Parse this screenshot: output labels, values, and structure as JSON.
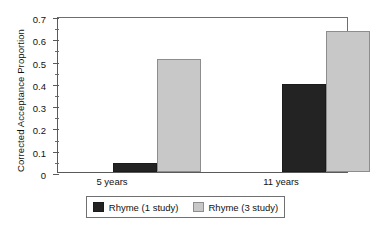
{
  "chart_data": {
    "type": "bar",
    "title": "",
    "xlabel": "",
    "ylabel": "Corrected Acceptance Proportion",
    "categories": [
      "5 years",
      "11 years"
    ],
    "series": [
      {
        "name": "Rhyme (1 study)",
        "values": [
          0.04,
          0.395
        ],
        "color": "#232323"
      },
      {
        "name": "Rhyme (3 study)",
        "values": [
          0.505,
          0.635
        ],
        "color": "#c8c8c8"
      }
    ],
    "ylim": [
      0,
      0.7
    ],
    "ytick_labels": [
      "0",
      "0.1",
      "0.2",
      "0.3",
      "0.4",
      "0.5",
      "0.6",
      "0.7"
    ],
    "ytick_values": [
      0,
      0.1,
      0.2,
      0.3,
      0.4,
      0.5,
      0.6,
      0.7
    ],
    "yminor_values": [
      0.05,
      0.15,
      0.25,
      0.35,
      0.45,
      0.55,
      0.65
    ],
    "grid": false,
    "legend_position": "bottom"
  },
  "axis": {
    "y_title": "Corrected Acceptance Proportion",
    "ticks": [
      {
        "label": "0.7",
        "value": 0.7
      },
      {
        "label": "0.6",
        "value": 0.6
      },
      {
        "label": "0.5",
        "value": 0.5
      },
      {
        "label": "0.4",
        "value": 0.4
      },
      {
        "label": "0.3",
        "value": 0.3
      },
      {
        "label": "0.2",
        "value": 0.2
      },
      {
        "label": "0.1",
        "value": 0.1
      },
      {
        "label": "0",
        "value": 0
      }
    ]
  },
  "groups": [
    {
      "label": "5 years",
      "dark": 0.04,
      "light": 0.505
    },
    {
      "label": "11 years",
      "dark": 0.395,
      "light": 0.635
    }
  ],
  "legend": {
    "entries": [
      {
        "label": "Rhyme (1 study)",
        "color": "#232323"
      },
      {
        "label": "Rhyme (3 study)",
        "color": "#c8c8c8"
      }
    ]
  }
}
